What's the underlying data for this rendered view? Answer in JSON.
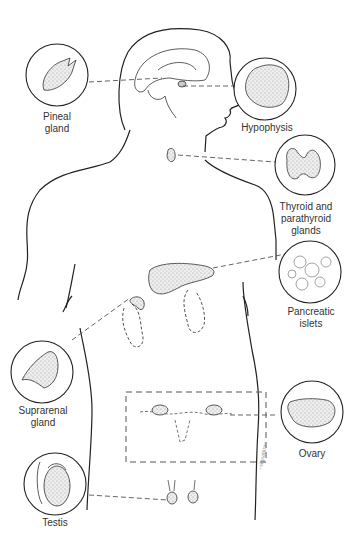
{
  "diagram": {
    "labels": {
      "pineal": "Pineal\ngland",
      "hypophysis": "Hypophysis",
      "thyroid": "Thyroid and\nparathyroid\nglands",
      "pancreas": "Pancreatic\nislets",
      "suprarenal": "Suprarenal\ngland",
      "ovary": "Ovary",
      "testis": "Testis"
    },
    "colors": {
      "line": "#222222",
      "dash": "#555555",
      "stipple": "#bbbbbb",
      "text": "#333333"
    }
  }
}
